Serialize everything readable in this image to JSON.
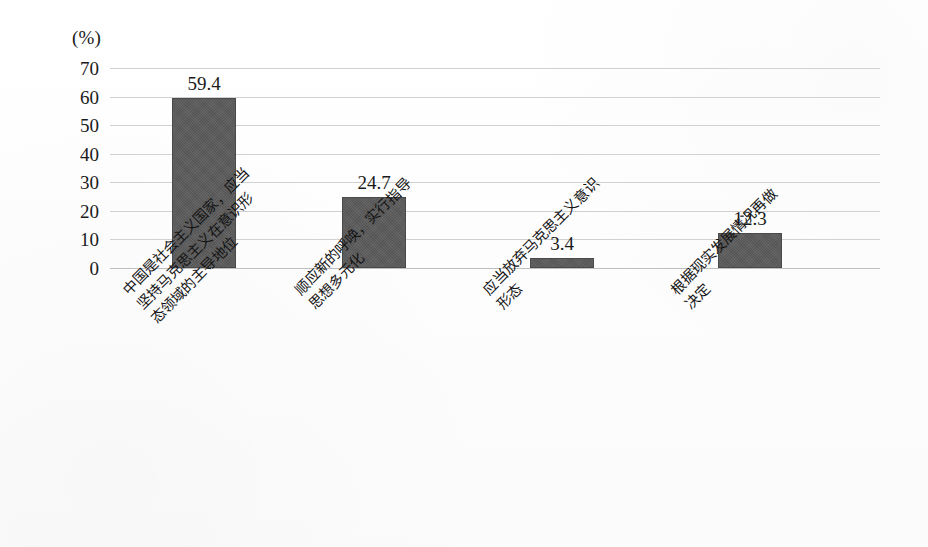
{
  "chart_data": {
    "type": "bar",
    "title": "",
    "subtitle": "",
    "xlabel": "",
    "ylabel": "",
    "unit_label": "(%)",
    "categories": [
      "中国是社会主义国家，应当坚持马克思主义在意识形态领域的主导地位",
      "顺应新的呼唤，实行指导思想多元化",
      "应当放弃马克思主义意识形态",
      "根据现实发展情况再做决定"
    ],
    "category_lines": [
      [
        "中国是社会主义国家，应当",
        "坚持马克思主义在意识形",
        "态领域的主导地位"
      ],
      [
        "顺应新的呼唤，实行指导",
        "思想多元化"
      ],
      [
        "应当放弃马克思主义意识",
        "形态"
      ],
      [
        "根据现实发展情况再做",
        "决定"
      ]
    ],
    "values": [
      59.4,
      24.7,
      3.4,
      12.3
    ],
    "value_labels": [
      "59.4",
      "24.7",
      "3.4",
      "12.3"
    ],
    "ylim": [
      0,
      70
    ],
    "ytick_step": 10,
    "yticks": [
      70,
      60,
      50,
      40,
      30,
      20,
      10,
      0
    ],
    "ytick_labels": [
      "70",
      "60",
      "50",
      "40",
      "30",
      "20",
      "10",
      "0"
    ],
    "grid": true,
    "grid_axis": "y",
    "legend": false,
    "legend_position": "none",
    "colors": {
      "bar_fill": "#595959",
      "bar_edge": "#4a4a4a",
      "gridline": "#c9c9c9",
      "baseline": "#b4b4b4",
      "text": "#141414",
      "background": "#ffffff"
    }
  }
}
